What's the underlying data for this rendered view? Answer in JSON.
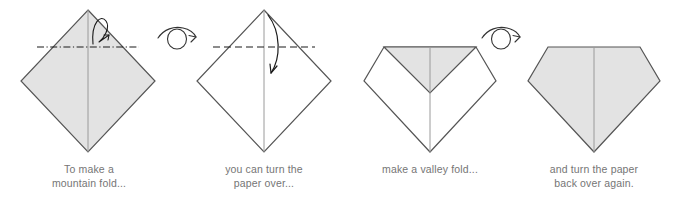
{
  "figure": {
    "width": 676,
    "height": 207,
    "background_color": "#ffffff"
  },
  "style": {
    "paper_front_color": "#e3e3e3",
    "paper_back_color": "#ffffff",
    "outline_color": "#555555",
    "crease_color": "#9a9a9a",
    "fold_line_color": "#1a1a1a",
    "arrow_color": "#1a1a1a",
    "caption_color": "#757575"
  },
  "panels": [
    {
      "id": "panel-1",
      "step": 1,
      "caption": "To make a\nmountain fold...",
      "shape": "diamond",
      "paper_side": "front",
      "fill": "#e3e3e3",
      "fold_line": {
        "name": "mountain-fold-line",
        "style": "dash-dot",
        "orientation": "horizontal"
      },
      "arrow": {
        "name": "mountain-fold-arrow",
        "type": "loop-back-arrow",
        "direction": "behind"
      },
      "center_crease": true
    },
    {
      "id": "panel-2",
      "step": 2,
      "caption": "you can turn the\npaper over...",
      "shape": "diamond",
      "paper_side": "back",
      "fill": "#ffffff",
      "fold_line": {
        "name": "valley-fold-line",
        "style": "dashed",
        "orientation": "horizontal"
      },
      "arrow": {
        "name": "valley-fold-arrow",
        "type": "curved-arrow",
        "direction": "down"
      },
      "center_crease": true
    },
    {
      "id": "panel-3",
      "step": 3,
      "caption": "make a valley fold...",
      "shape": "notched-diamond",
      "paper_side": "back",
      "fill": "#ffffff",
      "flap_fill": "#e3e3e3",
      "fold_line": null,
      "arrow": null,
      "center_crease": true
    },
    {
      "id": "panel-4",
      "step": 4,
      "caption": "and turn the paper\nback over again.",
      "shape": "pentagon",
      "paper_side": "front",
      "fill": "#e3e3e3",
      "fold_line": null,
      "arrow": null,
      "center_crease": true
    }
  ],
  "turnover_symbols": [
    {
      "id": "turnover-1",
      "name": "turn-over-symbol",
      "after_panel": 1,
      "meaning": "turn the paper over"
    },
    {
      "id": "turnover-2",
      "name": "turn-over-symbol",
      "after_panel": 3,
      "meaning": "turn the paper back over"
    }
  ]
}
